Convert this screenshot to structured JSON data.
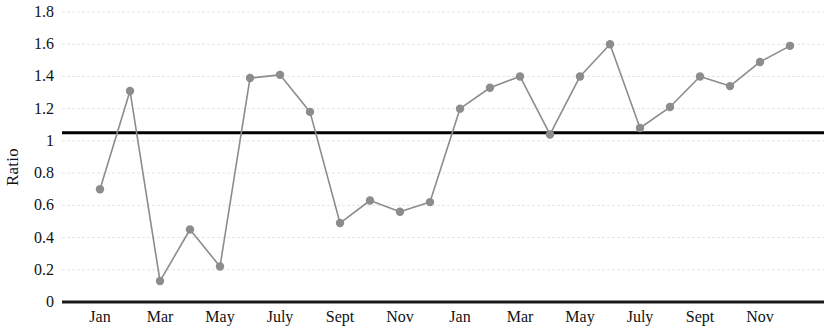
{
  "chart_data": {
    "type": "line",
    "title": "",
    "subtitle": "",
    "xlabel": "",
    "ylabel": "Ratio",
    "ylim": [
      0,
      1.8
    ],
    "ytick_values": [
      0,
      0.2,
      0.4,
      0.6,
      0.8,
      1,
      1.2,
      1.4,
      1.6,
      1.8
    ],
    "ytick_labels": [
      "0",
      "0.2",
      "0.4",
      "0.6",
      "0.8",
      "1",
      "1.2",
      "1.4",
      "1.6",
      "1.8"
    ],
    "grid": true,
    "grid_axis": "y",
    "legend": false,
    "legend_position": "none",
    "x": [
      1,
      2,
      3,
      4,
      5,
      6,
      7,
      8,
      9,
      10,
      11,
      12,
      13,
      14,
      15,
      16,
      17,
      18,
      19,
      20,
      21,
      22,
      23,
      24
    ],
    "categories": [
      "Jan",
      "Feb",
      "Mar",
      "Apr",
      "May",
      "June",
      "July",
      "Aug",
      "Sept",
      "Oct",
      "Nov",
      "Dec",
      "Jan",
      "Feb",
      "Mar",
      "Apr",
      "May",
      "June",
      "July",
      "Aug",
      "Sept",
      "Oct",
      "Nov",
      "Dec"
    ],
    "xtick_labels": [
      "Jan",
      "Mar",
      "May",
      "July",
      "Sept",
      "Nov",
      "Jan",
      "Mar",
      "May",
      "July",
      "Sept",
      "Nov"
    ],
    "xtick_positions": [
      1,
      3,
      5,
      7,
      9,
      11,
      13,
      15,
      17,
      19,
      21,
      23
    ],
    "series": [
      {
        "name": "Ratio",
        "color": "#8c8c8c",
        "marker": "circle",
        "values": [
          0.7,
          1.31,
          0.13,
          0.45,
          0.22,
          1.39,
          1.41,
          1.18,
          0.49,
          0.63,
          0.56,
          0.62,
          1.2,
          1.33,
          1.4,
          1.04,
          1.4,
          1.6,
          1.08,
          1.21,
          1.4,
          1.34,
          1.49,
          1.59
        ]
      }
    ],
    "reference_line": {
      "name": "threshold",
      "value": 1.05,
      "color": "#000000",
      "width": 3
    },
    "colors": {
      "series": "#8c8c8c",
      "reference": "#000000",
      "grid": "#e8e4e4",
      "axis": "#1a1a1a",
      "text": "#111111"
    }
  }
}
